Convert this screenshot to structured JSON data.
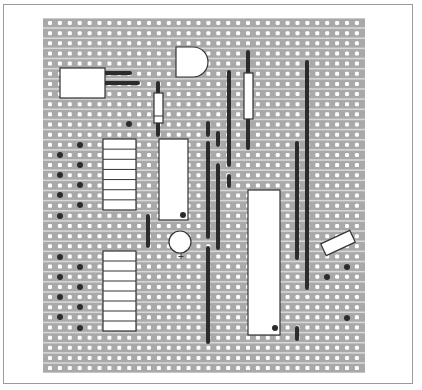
{
  "diagram": {
    "type": "stripboard-layout",
    "board": {
      "x": 43,
      "y": 18,
      "width": 322,
      "height": 355,
      "columns": 32,
      "rows": 35,
      "first_col_x": 50,
      "col_pitch": 9.9,
      "first_row_y": 23,
      "row_pitch": 10.15
    },
    "colors": {
      "strip": "#a9a9a9",
      "strip_gap": "#d8d8d8",
      "hole": "#ffffff",
      "wire": "#2b2b2b",
      "component": "#ffffff",
      "outline": "#333333"
    },
    "components": [
      {
        "name": "electrolytic-block",
        "kind": "box",
        "x": 60,
        "y": 68,
        "w": 45,
        "h": 30
      },
      {
        "name": "transistor",
        "kind": "d-shape",
        "x": 176,
        "y": 47,
        "w": 32,
        "h": 30
      },
      {
        "name": "resistor-1",
        "kind": "resistor",
        "x": 154,
        "y": 93,
        "w": 9,
        "h": 30,
        "band_y": 116
      },
      {
        "name": "resistor-2",
        "kind": "resistor",
        "x": 244,
        "y": 73,
        "w": 9,
        "h": 46
      },
      {
        "name": "header-upper",
        "kind": "header",
        "x": 103,
        "y": 139,
        "w": 33,
        "h": 71,
        "sections": 7
      },
      {
        "name": "header-lower",
        "kind": "header",
        "x": 103,
        "y": 251,
        "w": 33,
        "h": 80,
        "sections": 8
      },
      {
        "name": "ic-small",
        "kind": "ic",
        "x": 159,
        "y": 139,
        "w": 29,
        "h": 81,
        "pin1": [
          183,
          215
        ]
      },
      {
        "name": "ic-large",
        "kind": "ic",
        "x": 248,
        "y": 190,
        "w": 32,
        "h": 145,
        "pin1": [
          275,
          328
        ]
      },
      {
        "name": "capacitor",
        "kind": "circle",
        "cx": 180,
        "cy": 242,
        "r": 11,
        "label": "+"
      },
      {
        "name": "diode",
        "kind": "rotated-box",
        "cx": 338,
        "cy": 243,
        "w": 32,
        "h": 13,
        "angle": -25
      }
    ],
    "leads": [
      {
        "x1": 105,
        "y1": 73,
        "x2": 130,
        "y2": 73
      },
      {
        "x1": 105,
        "y1": 83,
        "x2": 138,
        "y2": 83
      },
      {
        "x1": 158,
        "y1": 83,
        "x2": 158,
        "y2": 93
      },
      {
        "x1": 158,
        "y1": 123,
        "x2": 158,
        "y2": 135
      },
      {
        "x1": 248,
        "y1": 52,
        "x2": 248,
        "y2": 73
      },
      {
        "x1": 248,
        "y1": 119,
        "x2": 248,
        "y2": 148
      }
    ],
    "wires": [
      {
        "x": 148,
        "y1": 216,
        "y2": 246
      },
      {
        "x": 208,
        "y1": 123,
        "y2": 135
      },
      {
        "x": 208,
        "y1": 143,
        "y2": 237
      },
      {
        "x": 208,
        "y1": 248,
        "y2": 342
      },
      {
        "x": 218,
        "y1": 133,
        "y2": 145
      },
      {
        "x": 218,
        "y1": 165,
        "y2": 248
      },
      {
        "x": 229,
        "y1": 72,
        "y2": 165
      },
      {
        "x": 229,
        "y1": 176,
        "y2": 186
      },
      {
        "x": 297,
        "y1": 143,
        "y2": 258
      },
      {
        "x": 307,
        "y1": 62,
        "y2": 288
      },
      {
        "x": 297,
        "y1": 328,
        "y2": 339
      }
    ],
    "solder_dots": [
      [
        129,
        124
      ],
      [
        80,
        145
      ],
      [
        60,
        155
      ],
      [
        80,
        165
      ],
      [
        60,
        175
      ],
      [
        80,
        185
      ],
      [
        60,
        195
      ],
      [
        80,
        205
      ],
      [
        60,
        216
      ],
      [
        60,
        257
      ],
      [
        80,
        267
      ],
      [
        60,
        277
      ],
      [
        80,
        287
      ],
      [
        60,
        297
      ],
      [
        80,
        307
      ],
      [
        60,
        317
      ],
      [
        80,
        328
      ],
      [
        347,
        267
      ],
      [
        327,
        277
      ],
      [
        347,
        318
      ]
    ]
  }
}
